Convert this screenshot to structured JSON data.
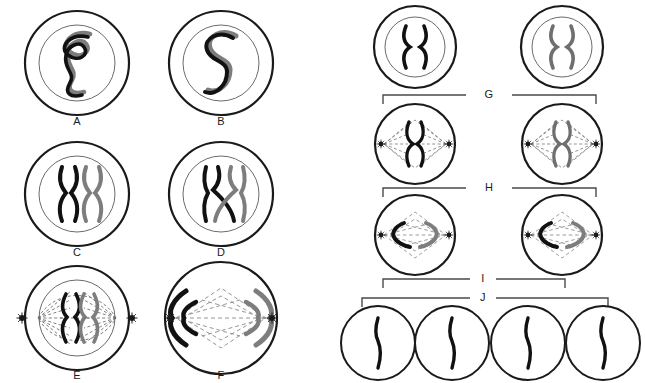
{
  "figure": {
    "background_color": "#ffffff",
    "ink_color": "#1a1a1a",
    "chromosome_dark_color": "#111111",
    "chromosome_gray_color": "#777777",
    "spindle_color": "#5a5a5a"
  },
  "left_panel": {
    "cells": [
      {
        "id": "A",
        "label": "A",
        "cx": 77,
        "cy": 63,
        "outer_r": 52,
        "inner_r": 38,
        "has_nuclear_membrane": true,
        "has_centrioles": false,
        "content": "tangled-thread-pair",
        "label_x": 77,
        "label_y": 122
      },
      {
        "id": "B",
        "label": "B",
        "cx": 221,
        "cy": 63,
        "outer_r": 52,
        "inner_r": 38,
        "has_nuclear_membrane": true,
        "has_centrioles": false,
        "content": "s-shaped-thread-pair",
        "label_x": 221,
        "label_y": 122
      },
      {
        "id": "C",
        "label": "C",
        "cx": 77,
        "cy": 194,
        "outer_r": 52,
        "inner_r": 38,
        "has_nuclear_membrane": true,
        "has_centrioles": false,
        "content": "two-parallel-x-chromosomes",
        "label_x": 77,
        "label_y": 253
      },
      {
        "id": "D",
        "label": "D",
        "cx": 221,
        "cy": 194,
        "outer_r": 52,
        "inner_r": 38,
        "has_nuclear_membrane": true,
        "has_centrioles": false,
        "content": "crossing-over-chromosomes",
        "label_x": 221,
        "label_y": 253
      },
      {
        "id": "E",
        "label": "E",
        "cx": 77,
        "cy": 318,
        "outer_r": 52,
        "inner_r": 38,
        "has_nuclear_membrane": true,
        "has_centrioles": true,
        "content": "metaphase-i-vertical-spindle",
        "label_x": 77,
        "label_y": 376
      },
      {
        "id": "F",
        "label": "F",
        "cx": 221,
        "cy": 318,
        "outer_r": 56,
        "inner_r": 0,
        "has_nuclear_membrane": false,
        "has_centrioles": true,
        "content": "anaphase-i-separating",
        "label_x": 221,
        "label_y": 376
      }
    ]
  },
  "right_panel": {
    "cells": [
      {
        "id": "G1",
        "cx": 415,
        "cy": 47,
        "outer_r": 41,
        "inner_r": 30,
        "has_nuclear_membrane": true,
        "has_centrioles": false,
        "content": "single-x-chromosome"
      },
      {
        "id": "G2",
        "cx": 562,
        "cy": 47,
        "outer_r": 41,
        "inner_r": 30,
        "has_nuclear_membrane": true,
        "has_centrioles": false,
        "content": "single-x-chromosome"
      },
      {
        "id": "H1",
        "cx": 415,
        "cy": 144,
        "outer_r": 40,
        "inner_r": 0,
        "has_nuclear_membrane": false,
        "has_centrioles": true,
        "content": "metaphase-ii-vertical-x"
      },
      {
        "id": "H2",
        "cx": 562,
        "cy": 144,
        "outer_r": 40,
        "inner_r": 0,
        "has_nuclear_membrane": false,
        "has_centrioles": true,
        "content": "metaphase-ii-vertical-x"
      },
      {
        "id": "I1",
        "cx": 415,
        "cy": 235,
        "outer_r": 40,
        "inner_r": 0,
        "has_nuclear_membrane": false,
        "has_centrioles": true,
        "content": "anaphase-ii-separating"
      },
      {
        "id": "I2",
        "cx": 562,
        "cy": 235,
        "outer_r": 40,
        "inner_r": 0,
        "has_nuclear_membrane": false,
        "has_centrioles": true,
        "content": "anaphase-ii-separating"
      },
      {
        "id": "J1",
        "cx": 378,
        "cy": 343,
        "outer_r": 37,
        "inner_r": 0,
        "has_nuclear_membrane": false,
        "has_centrioles": false,
        "content": "single-rod-chromosome"
      },
      {
        "id": "J2",
        "cx": 452,
        "cy": 343,
        "outer_r": 37,
        "inner_r": 0,
        "has_nuclear_membrane": false,
        "has_centrioles": false,
        "content": "single-rod-chromosome"
      },
      {
        "id": "J3",
        "cx": 528,
        "cy": 343,
        "outer_r": 37,
        "inner_r": 0,
        "has_nuclear_membrane": false,
        "has_centrioles": false,
        "content": "single-rod-chromosome"
      },
      {
        "id": "J4",
        "cx": 603,
        "cy": 343,
        "outer_r": 37,
        "inner_r": 0,
        "has_nuclear_membrane": false,
        "has_centrioles": false,
        "content": "single-rod-chromosome"
      }
    ],
    "brackets": [
      {
        "id": "G",
        "label": "G",
        "x1": 383,
        "x2": 596,
        "y": 95,
        "tick_height": 9,
        "label_x": 489,
        "label_y": 95,
        "direction": "up"
      },
      {
        "id": "H",
        "label": "H",
        "x1": 383,
        "x2": 596,
        "y": 188,
        "tick_height": 9,
        "label_x": 489,
        "label_y": 188,
        "direction": "up"
      },
      {
        "id": "I",
        "label": "I",
        "x1": 383,
        "x2": 565,
        "y": 279,
        "tick_height": 9,
        "label_x": 483,
        "label_y": 279,
        "direction": "up"
      },
      {
        "id": "J",
        "label": "J",
        "x1": 362,
        "x2": 608,
        "y": 298,
        "tick_height": 9,
        "label_x": 483,
        "label_y": 298,
        "direction": "down"
      }
    ]
  }
}
